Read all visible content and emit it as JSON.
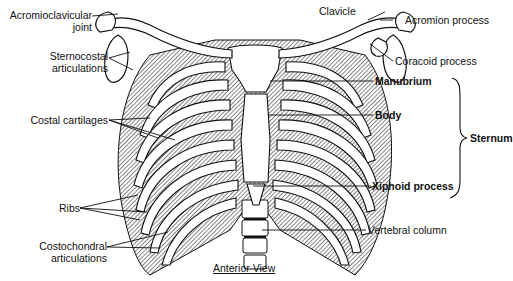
{
  "figure": {
    "title": "Anterior View",
    "labels_left": [
      {
        "id": "acromioclavicular-joint",
        "line1": "Acromioclavicular",
        "line2": "joint"
      },
      {
        "id": "sternocostal-articulations",
        "line1": "Sternocostal",
        "line2": "articulations"
      },
      {
        "id": "costal-cartilages",
        "line1": "Costal cartilages"
      },
      {
        "id": "ribs",
        "line1": "Ribs"
      },
      {
        "id": "costochondral-articulations",
        "line1": "Costochondral",
        "line2": "articulations"
      }
    ],
    "labels_right": [
      {
        "id": "clavicle",
        "text": "Clavicle"
      },
      {
        "id": "acromion-process",
        "text": "Acromion process"
      },
      {
        "id": "coracoid-process",
        "text": "Coracoid process"
      },
      {
        "id": "manubrium",
        "text": "Manubrium",
        "bold": true
      },
      {
        "id": "body",
        "text": "Body",
        "bold": true
      },
      {
        "id": "xiphoid-process",
        "text": "Xiphoid process",
        "bold": true
      },
      {
        "id": "vertebral-column",
        "text": "Vertebral column"
      }
    ],
    "bracket_label": "Sternum",
    "colors": {
      "ink": "#111111",
      "background": "#ffffff",
      "bone_fill": "#ffffff",
      "shade": "#555555"
    }
  }
}
